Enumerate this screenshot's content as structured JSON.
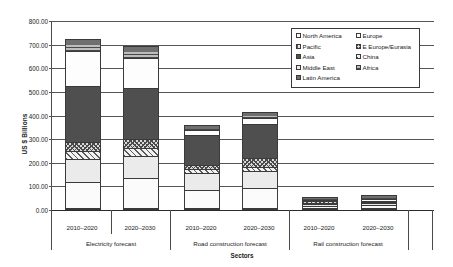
{
  "chart_data": {
    "type": "bar",
    "subtype": "stacked-bar",
    "title": "",
    "xlabel": "Sectors",
    "ylabel": "US $ Billions",
    "ylim": [
      0,
      800
    ],
    "ytick_step": 100,
    "ytick_labels": [
      "800.00",
      "700.00",
      "600.00",
      "500.00",
      "400.00",
      "300.00",
      "200.00",
      "100.00",
      "0.00"
    ],
    "ytick_values": [
      800,
      700,
      600,
      500,
      400,
      300,
      200,
      100,
      0
    ],
    "grid": true,
    "legend_position": "upper right",
    "categories": [
      "2010–2020",
      "2020–2030",
      "2010–2020",
      "2020–2030",
      "2010–2020",
      "2020–2030"
    ],
    "groups": [
      {
        "label": "Electricity forecast",
        "categories": [
          "2010–2020",
          "2020–2030"
        ]
      },
      {
        "label": "Road construction forecast",
        "categories": [
          "2010–2020",
          "2020–2030"
        ]
      },
      {
        "label": "Rail construction forecast",
        "categories": [
          "2010–2020",
          "2020–2030"
        ]
      }
    ],
    "series": [
      {
        "name": "North America",
        "key": "northamerica",
        "fill": "solid-white",
        "values": [
          110,
          128,
          80,
          88,
          13,
          16
        ]
      },
      {
        "name": "Pacific",
        "key": "pacific",
        "fill": "vertical-stripes",
        "values": [
          0,
          0,
          0,
          0,
          0,
          0
        ]
      },
      {
        "name": "Asia",
        "key": "asia",
        "fill": "solid-dark-grey",
        "values": [
          240,
          220,
          130,
          145,
          0,
          0
        ]
      },
      {
        "name": "Middle East",
        "key": "middleeast",
        "fill": "solid-light-grey",
        "values": [
          98,
          96,
          72,
          72,
          10,
          10
        ]
      },
      {
        "name": "Latin America",
        "key": "latinamerica",
        "fill": "solid-mid-grey",
        "values": [
          22,
          22,
          14,
          16,
          9,
          10
        ]
      },
      {
        "name": "Europe",
        "key": "europe",
        "fill": "solid-white",
        "values": [
          150,
          130,
          24,
          30,
          7,
          8
        ]
      },
      {
        "name": "E Europe/Eurasia",
        "key": "eeurope",
        "fill": "crosshatch",
        "values": [
          38,
          36,
          18,
          38,
          5,
          5
        ]
      },
      {
        "name": "China",
        "key": "china",
        "fill": "diagonal-hatch",
        "values": [
          35,
          34,
          15,
          18,
          4,
          5
        ]
      },
      {
        "name": "Africa",
        "key": "africa",
        "fill": "horizontal-stripes",
        "values": [
          30,
          30,
          8,
          9,
          8,
          9
        ]
      }
    ],
    "stack_order": [
      "North America",
      "Middle East",
      "China",
      "E Europe/Eurasia",
      "Asia",
      "Europe",
      "Africa",
      "Latin America",
      "Pacific"
    ],
    "bar_totals": [
      748,
      683,
      240,
      287,
      54,
      61
    ]
  },
  "axes": {
    "y": {
      "title": "US $ Billions",
      "ticks": [
        "800.00",
        "700.00",
        "600.00",
        "500.00",
        "400.00",
        "300.00",
        "200.00",
        "100.00",
        "0.00"
      ]
    },
    "x": {
      "title": "Sectors",
      "periods": [
        "2010–2020",
        "2020–2030",
        "2010–2020",
        "2020–2030",
        "2010–2020",
        "2020–2030"
      ],
      "groups": [
        "Electricity forecast",
        "Road construction forecast",
        "Rail construction forecast"
      ]
    }
  },
  "legend": {
    "items": [
      {
        "label": "North America",
        "key": "northamerica"
      },
      {
        "label": "Europe",
        "key": "europe"
      },
      {
        "label": "Pacific",
        "key": "pacific"
      },
      {
        "label": "E Europe/Eurasia",
        "key": "eeurope"
      },
      {
        "label": "Asia",
        "key": "asia"
      },
      {
        "label": "China",
        "key": "china"
      },
      {
        "label": "Middle East",
        "key": "middleeast"
      },
      {
        "label": "Africa",
        "key": "africa"
      },
      {
        "label": "Latin America",
        "key": "latinamerica"
      }
    ]
  },
  "colors": {
    "axis": "#4a4a4a",
    "grid": "#555555",
    "text": "#1a1a1a",
    "background": "#ffffff",
    "dark_fill": "#4f4f4f",
    "mid_fill": "#6f6f6f",
    "light_fill": "#ebebeb"
  }
}
